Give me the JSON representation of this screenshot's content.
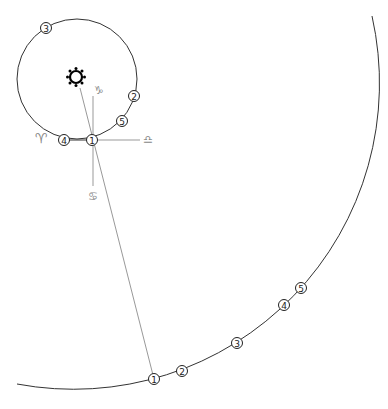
{
  "diagram": {
    "colors": {
      "orbit": "#333333",
      "guide": "#999999",
      "sign": "#888888",
      "sun": "#000000"
    },
    "sun": {
      "label": "Sun",
      "symbol": "sun-icon"
    },
    "inner_orbit": {
      "markers": [
        {
          "label": "1",
          "x": 92,
          "y": 140
        },
        {
          "label": "2",
          "x": 134,
          "y": 96
        },
        {
          "label": "3",
          "x": 46,
          "y": 28
        },
        {
          "label": "4",
          "x": 64,
          "y": 140
        },
        {
          "label": "5",
          "x": 122,
          "y": 121
        }
      ]
    },
    "outer_orbit": {
      "markers": [
        {
          "label": "1",
          "x": 154,
          "y": 379
        },
        {
          "label": "2",
          "x": 182,
          "y": 371
        },
        {
          "label": "3",
          "x": 237,
          "y": 343
        },
        {
          "label": "4",
          "x": 284,
          "y": 305
        },
        {
          "label": "5",
          "x": 301,
          "y": 288
        }
      ]
    },
    "signs": {
      "aries": "♈",
      "libra": "♎",
      "capricorn": "♑",
      "cancer": "♋"
    }
  }
}
